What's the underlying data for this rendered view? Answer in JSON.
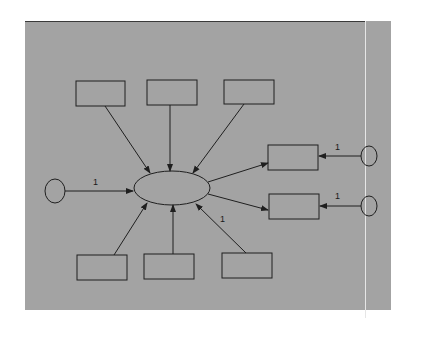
{
  "diagram": {
    "type": "structural-equation-model (MIMIC)",
    "colors": {
      "background": "#ffffff",
      "panel": "#a3a3a3",
      "panel_border": "#3a3a3a",
      "stroke": "#1f1f1f",
      "divider": "#e6e6e6"
    },
    "latent": {
      "id": "latent-factor",
      "shape": "ellipse",
      "label": ""
    },
    "error_terms": [
      {
        "id": "latent-disturbance",
        "shape": "circle",
        "label": "",
        "path_label": "1"
      },
      {
        "id": "indicator-error-1",
        "shape": "circle",
        "label": "",
        "path_label": "1"
      },
      {
        "id": "indicator-error-2",
        "shape": "circle",
        "label": "",
        "path_label": "1"
      }
    ],
    "causes": [
      {
        "id": "cause-top-1",
        "shape": "rectangle",
        "label": ""
      },
      {
        "id": "cause-top-2",
        "shape": "rectangle",
        "label": ""
      },
      {
        "id": "cause-top-3",
        "shape": "rectangle",
        "label": ""
      },
      {
        "id": "cause-bottom-1",
        "shape": "rectangle",
        "label": ""
      },
      {
        "id": "cause-bottom-2",
        "shape": "rectangle",
        "label": ""
      },
      {
        "id": "cause-bottom-3",
        "shape": "rectangle",
        "label": "",
        "path_label": "1"
      }
    ],
    "indicators": [
      {
        "id": "indicator-1",
        "shape": "rectangle",
        "label": ""
      },
      {
        "id": "indicator-2",
        "shape": "rectangle",
        "label": ""
      }
    ],
    "path_labels": {
      "disturbance": "1",
      "indicator_error_1": "1",
      "indicator_error_2": "1",
      "cause_bottom_3": "1"
    }
  }
}
